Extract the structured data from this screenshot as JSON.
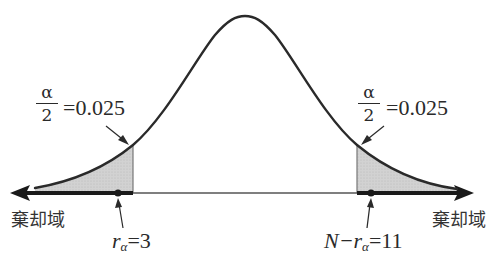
{
  "diagram": {
    "type": "normal-distribution-two-tailed-test",
    "colors": {
      "curve": "#2a2a2a",
      "shade": "#cfcfcf",
      "axis": "#555555",
      "rejection_axis": "#1a1a1a",
      "text": "#2a2a2a"
    },
    "left_tail": {
      "fraction_numerator": "α",
      "fraction_denominator": "2",
      "equals_value": "=0.025",
      "region_label": "棄却域",
      "critical_symbol": "r",
      "critical_subscript": "α",
      "critical_equals": "=3"
    },
    "right_tail": {
      "fraction_numerator": "α",
      "fraction_denominator": "2",
      "equals_value": "=0.025",
      "region_label": "棄却域",
      "critical_prefix": "N−",
      "critical_symbol": "r",
      "critical_subscript": "α",
      "critical_equals": "=11"
    }
  }
}
